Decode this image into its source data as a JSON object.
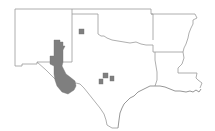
{
  "map": {
    "description": "Outline map of Texas and neighboring states with shaded regions",
    "region_states": [
      "New Mexico",
      "Oklahoma",
      "Arkansas",
      "Louisiana",
      "Texas"
    ],
    "colors": {
      "background": "#ffffff",
      "border": "#9a9a9a",
      "coastline": "#8a8a8a",
      "shaded_area": "#7f7f7f"
    },
    "shaded_areas": [
      {
        "id": "west-texas-nm-region",
        "label": "Western NM / Trans-Pecos region"
      },
      {
        "id": "panhandle-square",
        "label": "Texas Panhandle county"
      },
      {
        "id": "central-square-1",
        "label": "Central Texas county 1"
      },
      {
        "id": "central-square-2",
        "label": "Central Texas county 2"
      },
      {
        "id": "central-square-3",
        "label": "Central Texas county 3"
      }
    ]
  }
}
